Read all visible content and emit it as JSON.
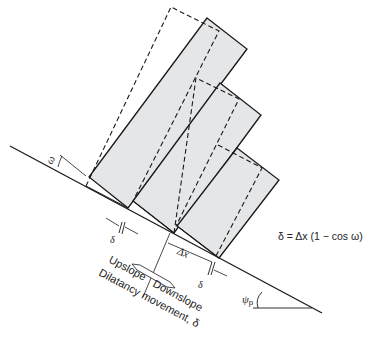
{
  "diagram": {
    "type": "block toppling / dilatancy on slope",
    "labels": {
      "omega": "ω",
      "delta_left": "δ",
      "delta_right": "δ",
      "delta_x": "Δx",
      "upslope": "Upslope",
      "downslope": "Downslope",
      "dilatancy": "Dilatancy movement, δ",
      "psi_p": "ψ",
      "psi_sub": "p",
      "formula": "δ = Δx (1 − cos ω)"
    },
    "colors": {
      "block_fill": "#e4e6e8",
      "line": "#1a1a1a"
    },
    "blocks": [
      {
        "name": "block-1",
        "solid": "207,18 247,49 128,208 89,177"
      },
      {
        "name": "block-2",
        "solid": "220,83 261,115 174,233 133,201"
      },
      {
        "name": "block-3",
        "solid": "237,148 279,180 219,258 177,226"
      }
    ]
  }
}
